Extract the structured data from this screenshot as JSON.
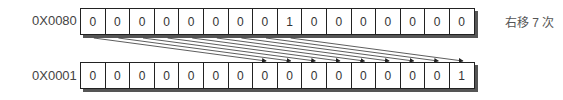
{
  "top": {
    "label": "0X0080 =",
    "bits": [
      "0",
      "0",
      "0",
      "0",
      "0",
      "0",
      "0",
      "0",
      "1",
      "0",
      "0",
      "0",
      "0",
      "0",
      "0",
      "0"
    ]
  },
  "bottom": {
    "label": "0X0001 =",
    "bits": [
      "0",
      "0",
      "0",
      "0",
      "0",
      "0",
      "0",
      "0",
      "0",
      "0",
      "0",
      "0",
      "0",
      "0",
      "0",
      "1"
    ]
  },
  "note": "右移 7 次",
  "shift": 7,
  "colors": {
    "line": "#222222",
    "shadow": "#555555",
    "text": "#444444"
  }
}
